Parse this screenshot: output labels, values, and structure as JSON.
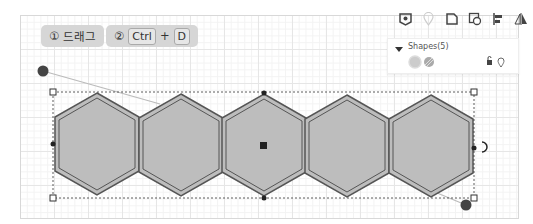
{
  "steps": [
    {
      "num": "①",
      "label": "드래그"
    },
    {
      "num": "②",
      "key1": "Ctrl",
      "plus": "+",
      "key2": "D"
    }
  ],
  "toolbar": {
    "icons": [
      "shield-eye-icon",
      "location-pin-icon",
      "shape-outline-icon",
      "copy-shape-icon",
      "align-icon",
      "flip-icon"
    ]
  },
  "panel": {
    "title": "Shapes(5)",
    "collapse_icon": "triangle-down-icon",
    "swatches": [
      "fill-swatch",
      "stroke-pattern-swatch"
    ],
    "actions": [
      "lock-icon",
      "location-pin-icon"
    ]
  },
  "canvas": {
    "shape_count": 5,
    "shape_type": "hexagon",
    "colors": {
      "fill": "#bdbdbd",
      "stroke": "#555555",
      "handle": "#444444",
      "selection": "#333333"
    }
  }
}
